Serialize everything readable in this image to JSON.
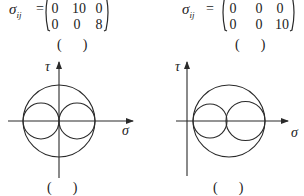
{
  "matrices": [
    {
      "symbol": "σ",
      "subscript": "ij",
      "equals": "=",
      "rows": [
        [
          "0",
          "10",
          "0"
        ],
        [
          "0",
          "0",
          "8"
        ]
      ],
      "caption": "(      )"
    },
    {
      "symbol": "σ",
      "subscript": "ij",
      "equals": "=",
      "rows": [
        [
          "0",
          "0",
          "0"
        ],
        [
          "0",
          "0",
          "10"
        ]
      ],
      "caption": "(      )"
    }
  ],
  "diagrams": [
    {
      "type": "mohr-circle",
      "y_axis_label": "τ",
      "x_axis_label": "σ",
      "big_circle": {
        "cx": 59,
        "cy": 121,
        "r": 36
      },
      "small_circles": [
        {
          "cx": 41,
          "cy": 121,
          "r": 18
        },
        {
          "cx": 77,
          "cy": 121,
          "r": 18
        }
      ],
      "caption": "(      )"
    },
    {
      "type": "mohr-circle",
      "y_axis_label": "τ",
      "x_axis_label": "σ",
      "big_circle": {
        "cx": 229,
        "cy": 121,
        "r": 36
      },
      "small_circles": [
        {
          "cx": 210,
          "cy": 121,
          "r": 17
        },
        {
          "cx": 245.5,
          "cy": 121,
          "r": 19.5
        }
      ],
      "caption": "(      )"
    }
  ],
  "colors": {
    "stroke": "#2a2a2a",
    "background": "#ffffff"
  }
}
